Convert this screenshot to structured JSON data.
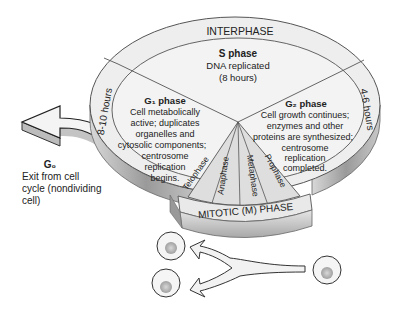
{
  "diagram": {
    "title": "Cell cycle",
    "ring_label": "INTERPHASE",
    "mitotic_label": "MITOTIC (M) PHASE",
    "s_phase": {
      "title": "S phase",
      "lines": [
        "DNA replicated",
        "(8 hours)"
      ]
    },
    "g1_phase": {
      "title": "G₁ phase",
      "lines": [
        "Cell metabolically",
        "active; duplicates",
        "organelles and",
        "cytosolic components;",
        "centrosome",
        "replication",
        "begins."
      ],
      "duration": "8-10 hours"
    },
    "g2_phase": {
      "title": "G₂ phase",
      "lines": [
        "Cell growth continues;",
        "enzymes and other",
        "proteins are synthesized;",
        "centrosome",
        "replication",
        "completed."
      ],
      "duration": "4-6 hours"
    },
    "g0": {
      "title": "G₀",
      "lines": [
        "Exit from cell",
        "cycle (nondividing",
        "cell)"
      ]
    },
    "mitosis_stages": [
      "Telophase",
      "Anaphase",
      "Metaphase",
      "Prophase"
    ],
    "colors": {
      "top_face": "#ececec",
      "side_face": "#b4b4b4",
      "outline": "#555555",
      "mitotic_wedge": "#dcdcdc",
      "arrow_fill": "#f2f2f2",
      "cell_nucleus": "#bdbdbd"
    }
  }
}
